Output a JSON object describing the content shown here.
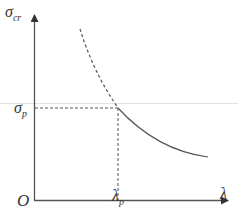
{
  "diagram": {
    "type": "critical-stress-vs-slenderness",
    "y_axis": {
      "symbol": "σ",
      "subscript": "cr"
    },
    "x_axis": {
      "symbol": "λ"
    },
    "origin_label": "O",
    "sigma_p": {
      "symbol": "σ",
      "subscript": "p"
    },
    "lambda_p": {
      "symbol": "λ",
      "subscript": "p"
    },
    "curve": {
      "dashed_segment": "Euler hyperbola beyond proportional limit (λ < λp)",
      "solid_segment": "Euler hyperbola valid region (λ ≥ λp)"
    },
    "colors": {
      "axis": "#444444",
      "curve": "#555555",
      "guide": "#dddddd"
    }
  }
}
